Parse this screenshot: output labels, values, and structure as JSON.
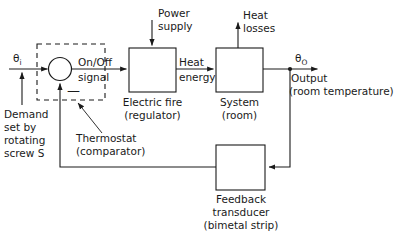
{
  "diagram": {
    "stroke_color": "#1a1a1a",
    "background_color": "#ffffff"
  },
  "signals": {
    "input_symbol": "θ",
    "input_subscript": "i",
    "output_symbol": "θ",
    "output_subscript": "O",
    "onoff_line1": "On/Off",
    "onoff_line2": "signal",
    "heat_energy_line1": "Heat",
    "heat_energy_line2": "energy",
    "power_supply_line1": "Power",
    "power_supply_line2": "supply",
    "heat_losses_line1": "Heat",
    "heat_losses_line2": "losses",
    "output_line1": "Output",
    "output_line2": "(room temperature)",
    "negative_sign": "—"
  },
  "blocks": [
    {
      "id": "electric-fire",
      "label_line1": "Electric fire",
      "label_line2": "(regulator)"
    },
    {
      "id": "system",
      "label_line1": "System",
      "label_line2": "(room)"
    },
    {
      "id": "feedback-transducer",
      "label_line1": "Feedback",
      "label_line2": "transducer",
      "label_line3": "(bimetal strip)"
    }
  ],
  "annotations": {
    "demand_line1": "Demand",
    "demand_line2": "set by",
    "demand_line3": "rotating",
    "demand_line4": "screw S",
    "thermostat_line1": "Thermostat",
    "thermostat_line2": "(comparator)"
  }
}
